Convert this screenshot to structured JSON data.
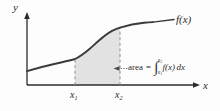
{
  "figure": {
    "type": "calculus-area-under-curve-diagram",
    "background_color": "#fdfdfd",
    "ink_color": "#2b2b2b",
    "shade_color": "#e2e2e2"
  },
  "axes": {
    "y_label": "y",
    "x_label": "x",
    "origin_px": [
      27,
      85
    ],
    "x_axis_end_px": [
      200,
      85
    ],
    "y_axis_top_px": [
      27,
      14
    ]
  },
  "curve": {
    "label": "f(x)",
    "shape": "sigmoid-increasing",
    "points_px": [
      [
        27,
        71
      ],
      [
        40,
        67
      ],
      [
        55,
        64
      ],
      [
        68,
        61
      ],
      [
        78,
        58
      ],
      [
        88,
        52
      ],
      [
        98,
        44
      ],
      [
        108,
        35
      ],
      [
        118,
        29
      ],
      [
        130,
        25
      ],
      [
        142,
        23
      ],
      [
        152,
        22
      ]
    ]
  },
  "markers": {
    "x1": {
      "label_base": "x",
      "label_sub": "1",
      "x_px": 75,
      "dashed": true
    },
    "x2": {
      "label_base": "x",
      "label_sub": "2",
      "x_px": 120,
      "dashed": true
    }
  },
  "shaded_region": {
    "from": "x1",
    "to": "x2",
    "fill": "#e2e2e2",
    "description": "area between curve and x-axis from x1 to x2"
  },
  "annotation": {
    "leader": "arrow-left-dotted",
    "word": "area",
    "equals": "=",
    "integral": {
      "sign": "∫",
      "lower_base": "x",
      "lower_sub": "1",
      "upper_base": "x",
      "upper_sub": "2",
      "integrand": "f(x)",
      "differential": "dx"
    },
    "full_text": "area = ∫ x1 to x2 f(x) dx"
  }
}
